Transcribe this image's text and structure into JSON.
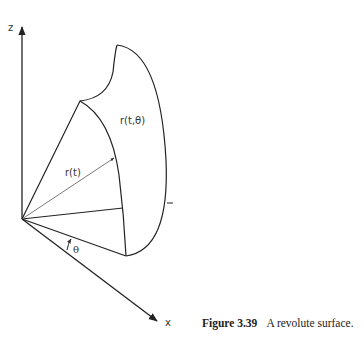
{
  "figure": {
    "caption_number": "Figure 3.39",
    "caption_text": "A revolute surface.",
    "axes": {
      "z_label": "z",
      "x_label": "x",
      "origin": [
        22,
        219
      ],
      "z_end": [
        22,
        26
      ],
      "x_end": [
        158,
        322
      ]
    },
    "labels": {
      "surface": "r(t,θ)",
      "profile_curve": "r(t)",
      "angle": "θ"
    },
    "stroke_color": "#222222",
    "background": "#ffffff"
  }
}
